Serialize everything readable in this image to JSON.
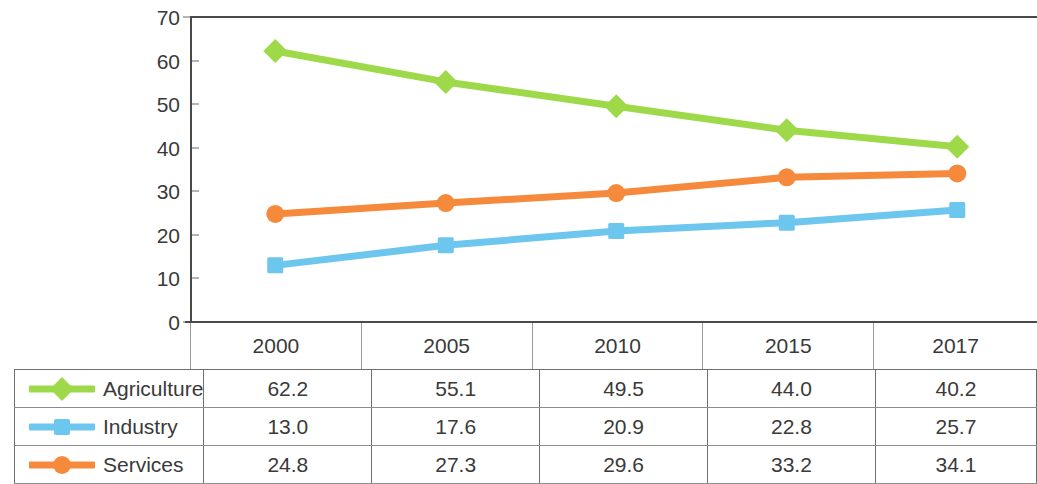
{
  "chart_data": {
    "type": "line",
    "title": "",
    "xlabel": "",
    "ylabel": "",
    "categories": [
      "2000",
      "2005",
      "2010",
      "2015",
      "2017"
    ],
    "series": [
      {
        "name": "Agriculture",
        "values": [
          62.2,
          55.1,
          49.5,
          44.0,
          40.2
        ],
        "color": "#9ED94A",
        "marker": "diamond"
      },
      {
        "name": "Industry",
        "values": [
          13.0,
          17.6,
          20.9,
          22.8,
          25.7
        ],
        "color": "#6CC6EE",
        "marker": "square"
      },
      {
        "name": "Services",
        "values": [
          24.8,
          27.3,
          29.6,
          33.2,
          34.1
        ],
        "color": "#F58A3C",
        "marker": "circle"
      }
    ],
    "ylim": [
      0,
      70
    ],
    "y_ticks": [
      "0",
      "10",
      "20",
      "30",
      "40",
      "50",
      "60",
      "70"
    ],
    "grid": false,
    "legend_position": "table-left-column",
    "value_labels": {
      "Agriculture": [
        "62.2",
        "55.1",
        "49.5",
        "44.0",
        "40.2"
      ],
      "Industry": [
        "13.0",
        "17.6",
        "20.9",
        "22.8",
        "25.7"
      ],
      "Services": [
        "24.8",
        "27.3",
        "29.6",
        "33.2",
        "34.1"
      ]
    }
  },
  "colors": {
    "agriculture": "#9ED94A",
    "industry": "#6CC6EE",
    "services": "#F58A3C",
    "axis": "#4a4a4a",
    "grid_line": "#8c8c8c",
    "text": "#3a3a3a"
  }
}
